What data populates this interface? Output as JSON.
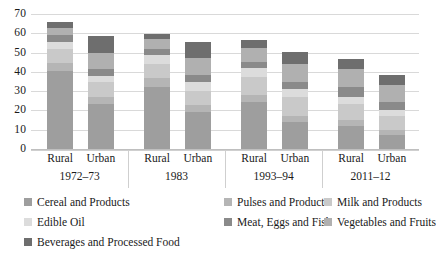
{
  "chart_data": {
    "type": "bar",
    "stacked": true,
    "title": "",
    "subtitle": "",
    "xlabel": "",
    "ylabel": "",
    "ylim": [
      0,
      70
    ],
    "ytick_step": 10,
    "yticks": [
      0,
      10,
      20,
      30,
      40,
      50,
      60,
      70
    ],
    "ytick_labels": [
      "0",
      "10",
      "20",
      "30",
      "40",
      "50",
      "60",
      "70"
    ],
    "grid": true,
    "grid_axis": "y",
    "legend_position": "bottom",
    "categories": [
      "Rural",
      "Urban",
      "Rural",
      "Urban",
      "Rural",
      "Urban",
      "Rural",
      "Urban"
    ],
    "groups": [
      {
        "label": "1972–73",
        "categories": [
          "Rural",
          "Urban"
        ]
      },
      {
        "label": "1983",
        "categories": [
          "Rural",
          "Urban"
        ]
      },
      {
        "label": "1993–94",
        "categories": [
          "Rural",
          "Urban"
        ]
      },
      {
        "label": "2011–12",
        "categories": [
          "Rural",
          "Urban"
        ]
      }
    ],
    "series": [
      {
        "name": "Cereal and Products",
        "color": "#9e9e9e",
        "values": [
          40.6,
          23.3,
          32.4,
          19.3,
          24.2,
          14.1,
          12.0,
          7.4
        ]
      },
      {
        "name": "Pulses and Products",
        "color": "#b5b5b5",
        "values": [
          4.2,
          3.6,
          4.3,
          3.4,
          3.8,
          3.0,
          3.1,
          2.4
        ]
      },
      {
        "name": "Milk and Products",
        "color": "#c9c9c9",
        "values": [
          7.3,
          7.8,
          7.5,
          7.5,
          9.5,
          9.8,
          8.0,
          7.2
        ]
      },
      {
        "name": "Edible Oil",
        "color": "#dcdcdc",
        "values": [
          3.5,
          3.4,
          4.6,
          4.8,
          4.4,
          4.4,
          3.7,
          3.1
        ]
      },
      {
        "name": "Meat, Eggs and Fish",
        "color": "#8a8a8a",
        "values": [
          3.3,
          3.3,
          3.3,
          3.3,
          3.3,
          3.3,
          5.3,
          4.4
        ]
      },
      {
        "name": "Vegetables and Fruits",
        "color": "#b0b0b0",
        "values": [
          4.1,
          8.6,
          5.0,
          9.0,
          7.2,
          9.6,
          9.5,
          8.6
        ]
      },
      {
        "name": "Beverages and Processed Food",
        "color": "#6e6e6e",
        "values": [
          3.0,
          8.4,
          2.4,
          8.2,
          4.1,
          6.3,
          5.2,
          5.3
        ]
      }
    ],
    "bar_totals": [
      66.0,
      58.4,
      59.5,
      55.5,
      56.5,
      50.5,
      46.8,
      38.4
    ]
  },
  "legend": {
    "items": [
      {
        "label": "Cereal and Products",
        "color": "#9e9e9e"
      },
      {
        "label": "Pulses and Products",
        "color": "#b5b5b5"
      },
      {
        "label": "Milk and Products",
        "color": "#c9c9c9"
      },
      {
        "label": "Edible Oil",
        "color": "#dcdcdc"
      },
      {
        "label": "Meat, Eggs and Fish",
        "color": "#8a8a8a"
      },
      {
        "label": "Vegetables and Fruits",
        "color": "#b0b0b0"
      },
      {
        "label": "Beverages and Processed Food",
        "color": "#6e6e6e"
      }
    ]
  }
}
